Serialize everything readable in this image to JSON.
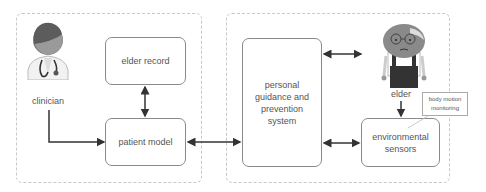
{
  "diagram": {
    "actors": {
      "clinician": {
        "label": "clinician",
        "icon": "doctor-icon"
      },
      "elder": {
        "label": "elder",
        "icon": "elderly-person-icon"
      }
    },
    "nodes": {
      "elder_record": {
        "label": "elder record"
      },
      "patient_model": {
        "label": "patient model"
      },
      "guidance_system": {
        "label": "personal guidance and prevention system",
        "lines": [
          "personal",
          "guidance and",
          "prevention",
          "system"
        ]
      },
      "environmental_sensors": {
        "label": "environmental sensors",
        "lines": [
          "environmental",
          "sensors"
        ]
      }
    },
    "callout": {
      "lines": [
        "body motion",
        "monitoring"
      ]
    },
    "edges": [
      {
        "from": "clinician",
        "to": "patient_model",
        "direction": "one-way"
      },
      {
        "from": "elder_record",
        "to": "patient_model",
        "direction": "bidirectional"
      },
      {
        "from": "patient_model",
        "to": "guidance_system",
        "direction": "bidirectional"
      },
      {
        "from": "guidance_system",
        "to": "elder",
        "direction": "bidirectional"
      },
      {
        "from": "guidance_system",
        "to": "environmental_sensors",
        "direction": "bidirectional"
      },
      {
        "from": "elder",
        "to": "environmental_sensors",
        "direction": "one-way"
      }
    ],
    "colors": {
      "stroke": "#333333",
      "box_border": "#8a8a8a",
      "container_border": "#c8c8c8"
    }
  }
}
